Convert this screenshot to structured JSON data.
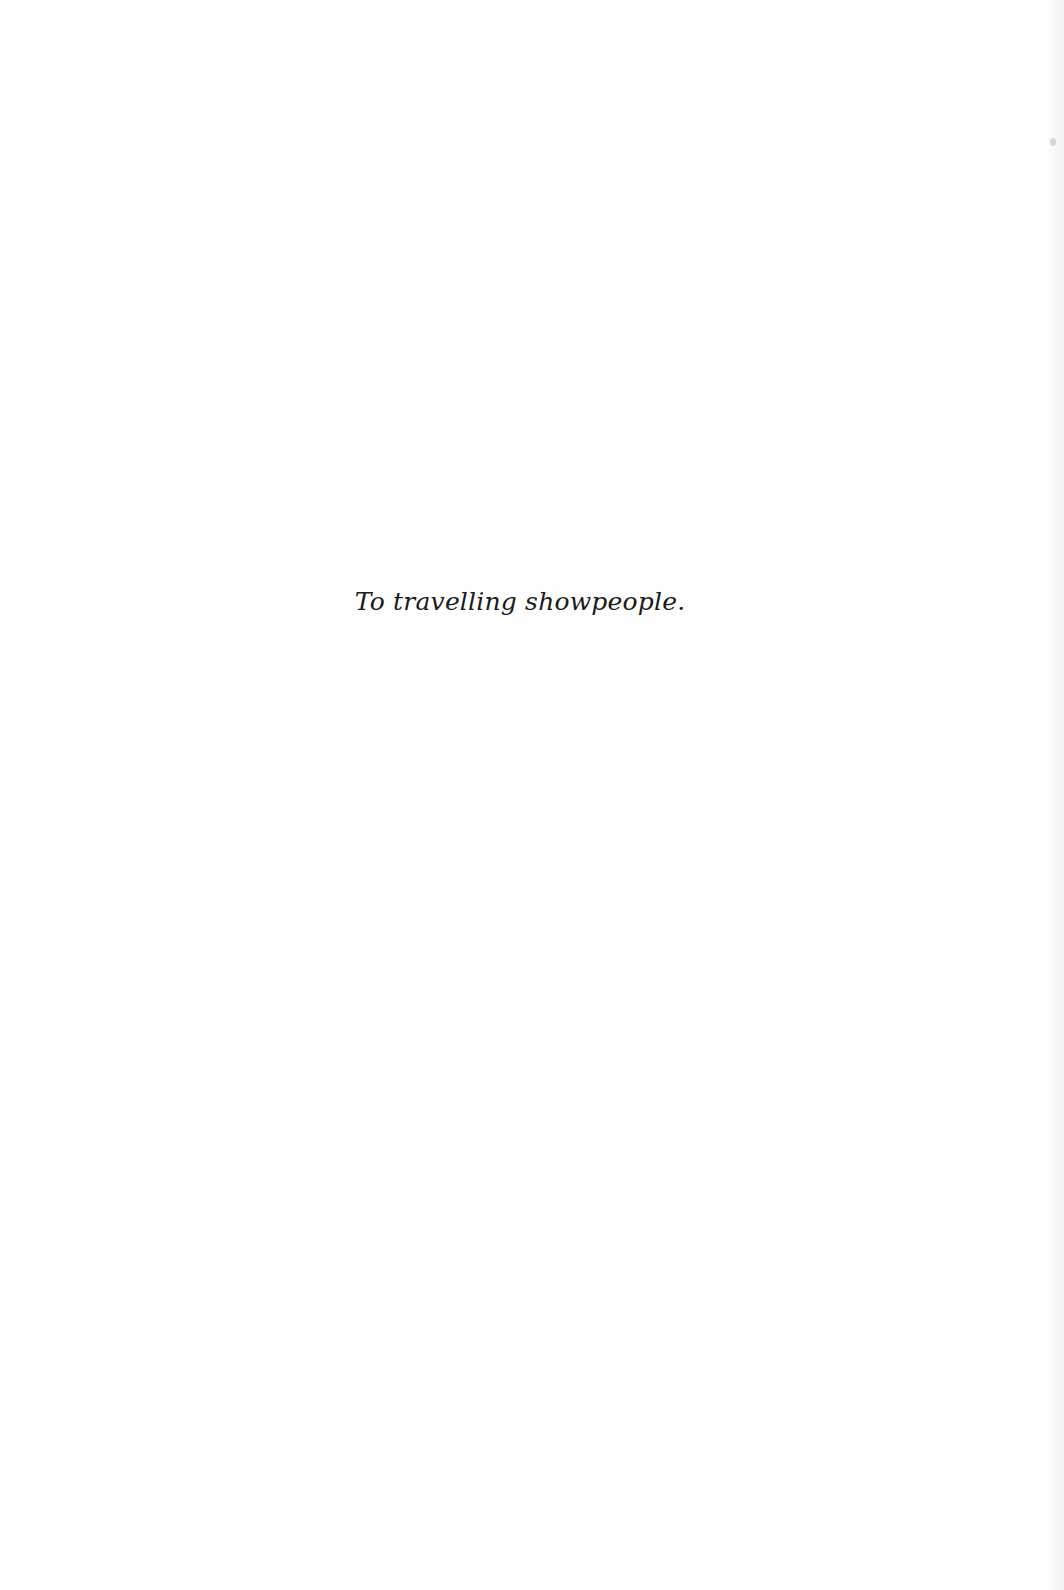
{
  "page": {
    "type": "dedication",
    "dedication_text": "To travelling showpeople."
  }
}
